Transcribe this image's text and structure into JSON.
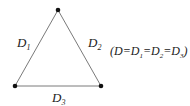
{
  "diagram": {
    "vertices": [
      {
        "name": "top",
        "x": 58,
        "y": 10
      },
      {
        "name": "bottom-left",
        "x": 15,
        "y": 86
      },
      {
        "name": "bottom-right",
        "x": 101,
        "y": 86
      }
    ],
    "edges": [
      {
        "label_main": "D",
        "label_sub": "1"
      },
      {
        "label_main": "D",
        "label_sub": "2"
      },
      {
        "label_main": "D",
        "label_sub": "3"
      }
    ],
    "formula": {
      "open": "(D=D",
      "s1": "1",
      "eq1": "=D",
      "s2": "2",
      "eq2": "=D",
      "s3": "3",
      "close": ")"
    },
    "colors": {
      "line": "#777777",
      "vertex": "#111111",
      "text": "#222222"
    }
  }
}
